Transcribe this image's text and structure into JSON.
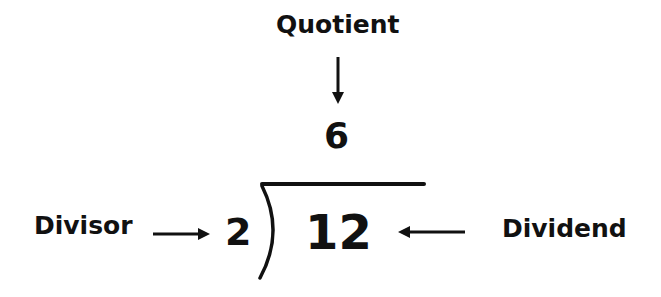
{
  "diagram": {
    "labels": {
      "quotient": "Quotient",
      "divisor": "Divisor",
      "dividend": "Dividend"
    },
    "values": {
      "quotient": "6",
      "divisor": "2",
      "dividend": "12"
    },
    "colors": {
      "ink": "#111111",
      "background": "#ffffff"
    }
  }
}
